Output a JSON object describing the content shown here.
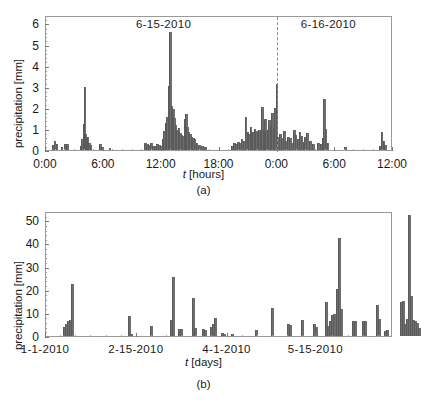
{
  "figure": {
    "panel_a_tag": "(a)",
    "panel_b_tag": "(b)"
  },
  "chart_data": [
    {
      "id": "panel-a",
      "type": "bar",
      "title": "",
      "xlabel": "t [hours]",
      "ylabel": "precipitation [mm]",
      "xtick_labels": [
        "0:00",
        "6:00",
        "12:00",
        "18:00",
        "0:00",
        "6:00",
        "12:00"
      ],
      "xtick_hours": [
        0,
        6,
        12,
        18,
        24,
        30,
        36
      ],
      "ytick_labels": [
        "0",
        "1",
        "2",
        "3",
        "4",
        "5",
        "6"
      ],
      "ytick_values": [
        0,
        1,
        2,
        3,
        4,
        5,
        6
      ],
      "xlim": [
        0,
        36
      ],
      "ylim": [
        0,
        6.4
      ],
      "grid": false,
      "legend": "none",
      "annotations": [
        {
          "text": "6-15-2010",
          "x_hours": 12.3,
          "y": 6.0
        },
        {
          "text": "6-16-2010",
          "x_hours": 29.4,
          "y": 6.0
        }
      ],
      "divider_line": {
        "x_hours": 24,
        "style": "dashed",
        "label": "midnight"
      },
      "bar_width_hours": 0.1667,
      "x": [
        0.7,
        0.9,
        1.1,
        1.6,
        2.0,
        2.2,
        3.6,
        3.75,
        3.9,
        4.0,
        4.1,
        4.2,
        4.3,
        4.45,
        4.6,
        5.6,
        5.8,
        6.6,
        10.3,
        10.5,
        10.7,
        10.9,
        11.1,
        11.3,
        11.5,
        11.7,
        11.9,
        12.1,
        12.25,
        12.4,
        12.55,
        12.7,
        12.85,
        13.0,
        13.15,
        13.3,
        13.45,
        13.6,
        13.75,
        13.9,
        14.05,
        14.2,
        14.35,
        14.5,
        14.65,
        14.8,
        14.95,
        15.1,
        15.25,
        15.4,
        15.6,
        15.9,
        16.2,
        16.5,
        19.3,
        19.5,
        19.7,
        19.9,
        20.1,
        20.3,
        20.5,
        20.7,
        20.9,
        21.05,
        21.2,
        21.35,
        21.5,
        21.65,
        21.8,
        21.95,
        22.1,
        22.25,
        22.4,
        22.55,
        22.7,
        22.85,
        23.0,
        23.15,
        23.3,
        23.45,
        23.6,
        23.75,
        23.9,
        24.1,
        24.3,
        24.5,
        24.7,
        24.9,
        25.1,
        25.3,
        25.5,
        25.7,
        25.9,
        26.1,
        26.3,
        26.5,
        26.7,
        26.9,
        27.1,
        27.4,
        27.7,
        28.2,
        28.5,
        28.7,
        28.85,
        29.0,
        29.2,
        31.0,
        34.6,
        34.8,
        35.0,
        35.2
      ],
      "values": [
        0.25,
        0.45,
        0.3,
        0.15,
        0.3,
        0.3,
        0.2,
        0.5,
        1.25,
        3.0,
        0.75,
        0.55,
        0.6,
        0.35,
        0.25,
        0.3,
        0.15,
        0.1,
        0.35,
        0.3,
        0.25,
        0.35,
        0.2,
        0.2,
        0.3,
        0.25,
        0.2,
        0.5,
        0.9,
        1.3,
        1.55,
        3.05,
        5.6,
        2.1,
        1.95,
        1.5,
        1.2,
        0.95,
        1.05,
        0.8,
        0.7,
        0.65,
        1.45,
        1.7,
        1.1,
        0.85,
        0.75,
        0.6,
        0.55,
        0.5,
        0.35,
        0.25,
        0.2,
        0.15,
        0.2,
        0.35,
        0.3,
        0.4,
        0.35,
        0.5,
        0.45,
        1.55,
        0.85,
        0.75,
        1.1,
        0.85,
        0.8,
        1.0,
        0.9,
        0.85,
        0.95,
        0.85,
        2.05,
        0.95,
        1.45,
        0.9,
        0.95,
        1.4,
        1.15,
        1.75,
        1.05,
        2.0,
        3.15,
        0.6,
        0.75,
        0.55,
        0.9,
        0.45,
        0.6,
        0.55,
        0.35,
        0.95,
        0.7,
        0.5,
        0.85,
        0.65,
        0.4,
        0.6,
        0.8,
        0.45,
        0.3,
        0.35,
        0.3,
        0.55,
        2.4,
        1.0,
        0.35,
        0.15,
        0.2,
        0.85,
        0.45,
        0.25
      ]
    },
    {
      "id": "panel-b",
      "type": "bar",
      "title": "",
      "xlabel": "t [days]",
      "ylabel": "precipitation [mm]",
      "xtick_labels": [
        "1-1-2010",
        "2-15-2010",
        "4-1-2010",
        "5-15-2010"
      ],
      "xtick_days": [
        0,
        45,
        90,
        134
      ],
      "ytick_labels": [
        "0",
        "10",
        "20",
        "30",
        "40",
        "50"
      ],
      "ytick_values": [
        0,
        10,
        20,
        30,
        40,
        50
      ],
      "xlim": [
        0,
        172
      ],
      "ylim": [
        0,
        54
      ],
      "grid": false,
      "legend": "none",
      "bar_width_days": 1.0,
      "x": [
        9,
        10,
        11,
        12,
        13,
        41,
        42,
        52,
        62,
        63,
        66,
        67,
        73,
        74,
        78,
        79,
        82,
        83,
        84,
        87,
        88,
        92,
        104,
        112,
        120,
        121,
        127,
        133,
        134,
        139,
        140,
        141,
        142,
        143,
        144,
        145,
        146,
        152,
        153,
        157,
        158,
        164,
        165,
        168,
        169,
        176,
        177,
        178,
        179,
        180,
        181,
        182,
        183,
        184,
        185
      ],
      "values": [
        4.0,
        5.0,
        6.5,
        7.0,
        22.3,
        8.7,
        1.0,
        4.3,
        7.1,
        25.6,
        3.0,
        3.1,
        16.4,
        3.4,
        3.0,
        2.6,
        4.1,
        5.0,
        7.9,
        1.2,
        1.0,
        1.0,
        2.8,
        12.2,
        5.2,
        4.9,
        6.9,
        5.1,
        4.0,
        14.9,
        4.4,
        6.5,
        8.9,
        9.5,
        20.5,
        42.5,
        11.6,
        6.3,
        6.3,
        6.4,
        6.4,
        13.4,
        7.2,
        2.3,
        2.4,
        14.8,
        15.0,
        5.0,
        7.2,
        52.2,
        17.3,
        6.8,
        6.4,
        5.6,
        3.4,
        3.3
      ]
    }
  ],
  "style": {
    "bar_color": "#6e6e6e",
    "frame_color": "#9a9a9a",
    "text_color": "#1a1a1a",
    "background": "#ffffff"
  }
}
